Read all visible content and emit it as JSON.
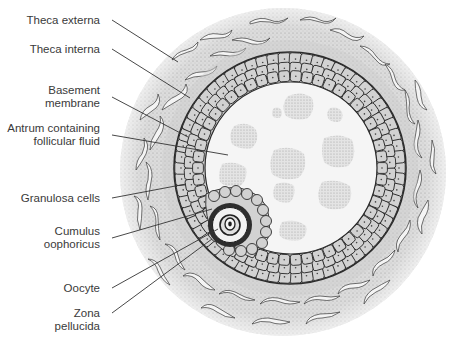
{
  "diagram": {
    "labels": [
      {
        "id": "theca-externa",
        "lines": [
          "Theca externa"
        ]
      },
      {
        "id": "theca-interna",
        "lines": [
          "Theca interna"
        ]
      },
      {
        "id": "basement-membrane",
        "lines": [
          "Basement",
          "membrane"
        ]
      },
      {
        "id": "antrum",
        "lines": [
          "Antrum containing",
          "follicular fluid"
        ]
      },
      {
        "id": "granulosa-cells",
        "lines": [
          "Granulosa cells"
        ]
      },
      {
        "id": "cumulus-oophoricus",
        "lines": [
          "Cumulus",
          "oophoricus"
        ]
      },
      {
        "id": "oocyte",
        "lines": [
          "Oocyte"
        ]
      },
      {
        "id": "zona-pellucida",
        "lines": [
          "Zona",
          "pellucida"
        ]
      }
    ],
    "colors": {
      "theca_fill": "#d9d9d9",
      "granulosa_fill": "#cfcfcf",
      "antrum_fill": "#f7f7f7",
      "outline": "#2b2b2b",
      "label_text": "#3a3a3a",
      "leader_line": "#333333"
    }
  }
}
